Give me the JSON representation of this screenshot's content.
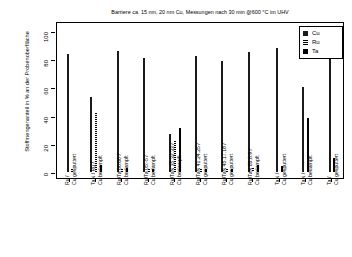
{
  "chart_data": {
    "type": "bar",
    "title": "Barriere ca. 15 nm, 20 nm Cu, Messungen nach 30 min @600 °C im UHV",
    "xlabel": "",
    "ylabel": "Stoffmengenanteil in % an der Probenoberfläche",
    "ylim": [
      0,
      100
    ],
    "yticks": [
      0,
      20,
      40,
      60,
      80,
      100
    ],
    "grid": false,
    "legend_position": "top-right",
    "categories": [
      "Ru /\nCu gesputtert",
      "TaN / Ru /\nCu bedampft",
      "Ru/Ta 60:60 /\nCu bedampft",
      "Ru/Ta 05:-5 /\nCu bedampft",
      "Ru/TaN 35.32.33 /\nCu bedampft",
      "Ru/TaN 41.24.25 /\nCu gesputtert",
      "Ru/TaN 45.17.18 /\nCu gesputtert",
      "Ru/TaN 83.8.9 /\nCu bedampft",
      "TaN /\nCu gesputtert",
      "TaN /\nCu bedampft",
      "Ta /\nCu gesputtert"
    ],
    "category_lines": [
      [
        "Ru /",
        "Cu gesputtert"
      ],
      [
        "TaN / Ru /",
        "Cu bedampft"
      ],
      [
        "Ru/Ta 60:60 /",
        "Cu bedampft"
      ],
      [
        "Ru/Ta 05:-5 /",
        "Cu bedampft"
      ],
      [
        "Ru/TaN 35.32.33 /",
        "Cu bedampft"
      ],
      [
        "Ru/TaN 41.24.25 /",
        "Cu gesputtert"
      ],
      [
        "Ru/TaN 45.17.18 /",
        "Cu gesputtert"
      ],
      [
        "Ru/TaN 83.8.9 /",
        "Cu bedampft"
      ],
      [
        "TaN /",
        "Cu gesputtert"
      ],
      [
        "TaN /",
        "Cu bedampft"
      ],
      [
        "Ta /",
        "Cu gesputtert"
      ]
    ],
    "series": [
      {
        "name": "Cu",
        "color": "#1a1a1a",
        "values": [
          84,
          53,
          86,
          81,
          27,
          82,
          79,
          85,
          88,
          60,
          80
        ]
      },
      {
        "name": "Ru",
        "color": "#333333",
        "values": [
          2,
          42,
          2,
          2,
          22,
          2,
          2,
          3,
          0,
          0,
          0
        ]
      },
      {
        "name": "Ta",
        "color": "#000000",
        "values": [
          0,
          5,
          3,
          2,
          31,
          2,
          2,
          5,
          4,
          38,
          10
        ]
      }
    ]
  },
  "legend": {
    "items": [
      {
        "label": "Cu",
        "key": "cu"
      },
      {
        "label": "Ru",
        "key": "ru"
      },
      {
        "label": "Ta",
        "key": "ta"
      }
    ]
  }
}
